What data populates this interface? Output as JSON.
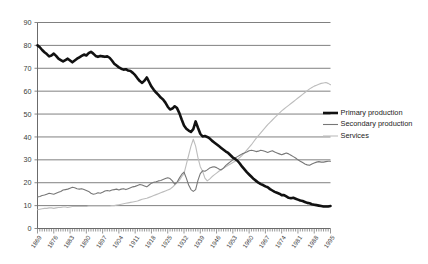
{
  "chart_data": {
    "type": "line",
    "title": "",
    "subtitle": "",
    "xlabel": "",
    "ylabel": "",
    "ylim": [
      0,
      90
    ],
    "ytick_step": 10,
    "grid": true,
    "legend_position": "right",
    "yticks": [
      "0",
      "10",
      "20",
      "30",
      "40",
      "50",
      "60",
      "70",
      "80",
      "90"
    ],
    "x_tick_labels": [
      "1869",
      "1876",
      "1883",
      "1890",
      "1897",
      "1904",
      "1911",
      "1918",
      "1925",
      "1932",
      "1939",
      "1946",
      "1953",
      "1960",
      "1967",
      "1974",
      "1981",
      "1988",
      "1995"
    ],
    "x_label_step": 7,
    "x_start_year": 1869,
    "x_end_year": 1995,
    "legend": [
      {
        "name": "Primary production",
        "color": "#111111",
        "width": 2.6
      },
      {
        "name": "Secondary production",
        "color": "#777777",
        "width": 1.1
      },
      {
        "name": "Services",
        "color": "#bdbdbd",
        "width": 1.1
      }
    ],
    "series": [
      {
        "name": "Primary production",
        "color": "#111111",
        "values": [
          80.0,
          79.2,
          78.0,
          77.0,
          76.2,
          75.2,
          75.6,
          76.4,
          75.4,
          74.2,
          73.6,
          73.0,
          73.6,
          74.2,
          73.4,
          72.6,
          73.4,
          74.2,
          74.8,
          75.4,
          76.0,
          75.6,
          76.6,
          77.2,
          76.4,
          75.4,
          75.0,
          75.4,
          75.2,
          75.0,
          75.2,
          74.6,
          73.4,
          72.0,
          71.2,
          70.4,
          69.8,
          69.4,
          69.6,
          69.0,
          68.8,
          68.0,
          67.0,
          65.6,
          64.4,
          63.6,
          64.6,
          66.0,
          64.0,
          62.0,
          60.6,
          59.4,
          58.4,
          57.2,
          56.4,
          55.0,
          53.2,
          52.0,
          52.4,
          53.4,
          52.6,
          50.4,
          47.6,
          45.0,
          43.6,
          42.8,
          42.2,
          43.4,
          46.8,
          44.0,
          41.4,
          40.2,
          40.4,
          40.0,
          39.4,
          38.4,
          37.6,
          36.8,
          36.0,
          35.2,
          34.4,
          33.6,
          33.0,
          32.0,
          31.0,
          30.4,
          29.6,
          28.4,
          27.0,
          25.8,
          24.6,
          23.6,
          22.6,
          21.6,
          20.8,
          20.0,
          19.4,
          19.0,
          18.4,
          18.0,
          17.2,
          16.6,
          16.0,
          15.6,
          15.2,
          14.6,
          14.6,
          14.0,
          13.4,
          13.2,
          13.4,
          13.0,
          12.6,
          12.2,
          12.0,
          11.6,
          11.2,
          11.0,
          10.6,
          10.4,
          10.2,
          10.0,
          9.8,
          9.6,
          9.6,
          9.6,
          9.8
        ]
      },
      {
        "name": "Secondary production",
        "color": "#777777",
        "values": [
          13.8,
          14.0,
          14.4,
          14.6,
          15.0,
          15.4,
          15.2,
          15.0,
          15.4,
          15.8,
          16.2,
          16.8,
          17.0,
          17.2,
          17.6,
          18.0,
          17.8,
          17.4,
          17.2,
          17.4,
          17.0,
          16.6,
          16.2,
          15.4,
          15.0,
          15.2,
          15.6,
          15.4,
          15.8,
          16.4,
          16.6,
          16.4,
          16.8,
          17.0,
          17.2,
          16.8,
          17.2,
          17.4,
          17.0,
          17.4,
          17.8,
          18.2,
          18.4,
          18.8,
          19.2,
          19.0,
          18.6,
          18.2,
          19.0,
          19.8,
          20.2,
          20.4,
          20.8,
          21.0,
          21.4,
          21.8,
          22.2,
          21.8,
          20.8,
          19.4,
          20.2,
          22.0,
          23.6,
          24.6,
          22.0,
          19.0,
          17.0,
          16.2,
          17.0,
          21.0,
          24.0,
          25.2,
          25.0,
          25.6,
          26.4,
          26.8,
          27.0,
          26.6,
          26.0,
          25.6,
          26.4,
          27.6,
          28.4,
          29.2,
          30.0,
          30.8,
          31.4,
          32.0,
          32.6,
          33.0,
          33.4,
          34.0,
          34.2,
          34.0,
          33.6,
          33.8,
          34.2,
          34.0,
          33.6,
          33.2,
          33.6,
          34.0,
          33.4,
          33.0,
          32.6,
          32.2,
          32.6,
          33.0,
          32.6,
          32.0,
          31.4,
          30.8,
          30.0,
          29.4,
          28.8,
          28.2,
          27.8,
          27.6,
          28.2,
          28.6,
          29.0,
          29.2,
          29.0,
          29.0,
          29.2,
          29.4,
          29.4
        ]
      },
      {
        "name": "Services",
        "color": "#bdbdbd",
        "values": [
          8.2,
          8.4,
          8.6,
          8.8,
          8.8,
          9.0,
          9.0,
          8.8,
          9.0,
          9.2,
          9.2,
          9.4,
          9.4,
          9.2,
          9.4,
          9.6,
          9.6,
          9.6,
          9.6,
          9.6,
          9.6,
          9.6,
          9.8,
          9.8,
          9.8,
          9.8,
          9.8,
          9.8,
          9.8,
          9.8,
          9.8,
          9.8,
          10.0,
          10.0,
          10.2,
          10.4,
          10.6,
          10.8,
          11.0,
          11.2,
          11.4,
          11.6,
          11.8,
          12.0,
          12.4,
          12.8,
          13.0,
          13.2,
          13.6,
          14.0,
          14.4,
          14.8,
          15.2,
          15.6,
          16.0,
          16.4,
          16.8,
          17.2,
          18.0,
          19.0,
          20.0,
          21.0,
          22.6,
          24.0,
          28.0,
          32.0,
          36.0,
          39.0,
          36.0,
          31.0,
          27.0,
          25.0,
          22.0,
          20.8,
          21.6,
          22.6,
          23.4,
          24.2,
          25.0,
          25.8,
          26.4,
          27.0,
          27.6,
          28.2,
          28.8,
          29.4,
          30.2,
          31.0,
          32.0,
          33.0,
          34.2,
          35.4,
          36.6,
          38.0,
          39.4,
          40.6,
          41.8,
          43.0,
          44.2,
          45.4,
          46.4,
          47.4,
          48.4,
          49.4,
          50.4,
          51.4,
          52.2,
          53.0,
          53.8,
          54.6,
          55.4,
          56.2,
          57.0,
          57.8,
          58.6,
          59.4,
          60.2,
          61.0,
          61.6,
          62.2,
          62.6,
          63.0,
          63.4,
          63.6,
          63.8,
          63.4,
          62.8
        ]
      }
    ]
  }
}
